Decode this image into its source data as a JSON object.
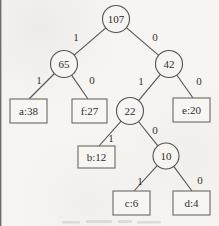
{
  "figure": {
    "kind": "huffman-coding-tree-diagram",
    "background_color": "#f6f5f2",
    "line_color": "#55524d",
    "text_color": "#2f2d29"
  },
  "nodes": [
    {
      "id": "sum-107",
      "shape": "circle",
      "label": "107"
    },
    {
      "id": "sum-65",
      "shape": "circle",
      "label": "65"
    },
    {
      "id": "sum-42",
      "shape": "circle",
      "label": "42"
    },
    {
      "id": "sum-22",
      "shape": "circle",
      "label": "22"
    },
    {
      "id": "sum-10",
      "shape": "circle",
      "label": "10"
    },
    {
      "id": "leaf-a",
      "shape": "rect",
      "label": "a:38",
      "symbol": "a",
      "freq": 38
    },
    {
      "id": "leaf-f",
      "shape": "rect",
      "label": "f:27",
      "symbol": "f",
      "freq": 27
    },
    {
      "id": "leaf-e",
      "shape": "rect",
      "label": "e:20",
      "symbol": "e",
      "freq": 20
    },
    {
      "id": "leaf-b",
      "shape": "rect",
      "label": "b:12",
      "symbol": "b",
      "freq": 12
    },
    {
      "id": "leaf-c",
      "shape": "rect",
      "label": "c:6",
      "symbol": "c",
      "freq": 6
    },
    {
      "id": "leaf-d",
      "shape": "rect",
      "label": "d:4",
      "symbol": "d",
      "freq": 4
    }
  ],
  "edges": [
    {
      "from": "sum-107",
      "to": "sum-65",
      "bit": "1"
    },
    {
      "from": "sum-107",
      "to": "sum-42",
      "bit": "0"
    },
    {
      "from": "sum-65",
      "to": "leaf-a",
      "bit": "1"
    },
    {
      "from": "sum-65",
      "to": "leaf-f",
      "bit": "0"
    },
    {
      "from": "sum-42",
      "to": "sum-22",
      "bit": "1"
    },
    {
      "from": "sum-42",
      "to": "leaf-e",
      "bit": "0"
    },
    {
      "from": "sum-22",
      "to": "leaf-b",
      "bit": "1"
    },
    {
      "from": "sum-22",
      "to": "sum-10",
      "bit": "0"
    },
    {
      "from": "sum-10",
      "to": "leaf-c",
      "bit": "1"
    },
    {
      "from": "sum-10",
      "to": "leaf-d",
      "bit": "0"
    }
  ]
}
